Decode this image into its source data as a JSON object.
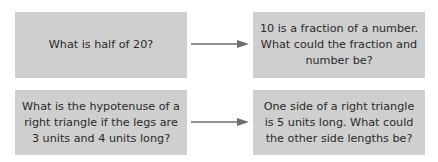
{
  "diagram": {
    "rows": [
      {
        "from": "What is half of 20?",
        "to": "10 is a fraction of a number. What could the fraction and number be?"
      },
      {
        "from": "What is the hypotenuse of a right triangle if the legs are 3 units and 4 units long?",
        "to": "One side of a right triangle is 5 units long. What could the other side lengths be?"
      }
    ],
    "colors": {
      "box": "#cfcfcf",
      "arrow": "#6e6e6e",
      "text": "#2a2a2a"
    }
  }
}
